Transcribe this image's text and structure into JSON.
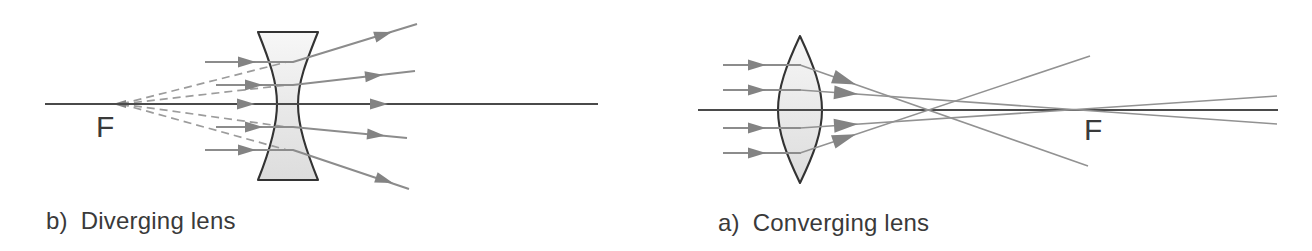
{
  "palette": {
    "background": "#ffffff",
    "ray": "#8c8c8c",
    "ray_thin": "#929292",
    "arrow": "#838383",
    "axis": "#4a4a4a",
    "dashed": "#9c9c9c",
    "lens_outline": "#333333",
    "lens_fill_top": "#f7f7f7",
    "lens_fill_mid": "#e9e9e9",
    "lens_fill_bottom": "#dddddd",
    "text": "#3a3a3a"
  },
  "diagrams": [
    {
      "id": "diverging",
      "caption_prefix": "b)",
      "caption": "Diverging lens",
      "focal_label": "F",
      "lens_shape": "biconcave",
      "incoming_parallel_rays": 5,
      "virtual_rays": "dashed back-extensions meeting at F left of the lens"
    },
    {
      "id": "converging",
      "caption_prefix": "a)",
      "caption": "Converging lens",
      "focal_label": "F",
      "lens_shape": "biconvex",
      "incoming_parallel_rays": 4,
      "virtual_rays": "refracted rays cross the optical axis near F"
    }
  ]
}
